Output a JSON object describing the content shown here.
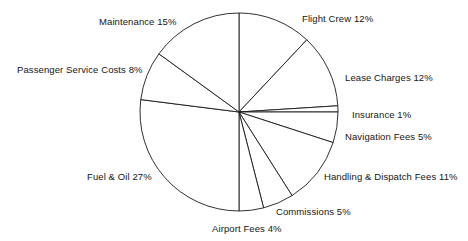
{
  "chart_data": {
    "type": "pie",
    "title": "",
    "subtitle": "",
    "xlabel": "",
    "ylabel": "",
    "legend_position": "none",
    "grid": false,
    "start_angle_deg": 0,
    "direction": "clockwise",
    "units": "percent",
    "total": 100,
    "categories": [
      "Flight Crew",
      "Lease Charges",
      "Insurance",
      "Navigation Fees",
      "Handling & Dispatch Fees",
      "Commissions",
      "Airport Fees",
      "Fuel & Oil",
      "Passenger Service Costs",
      "Maintenance"
    ],
    "values": [
      12,
      12,
      1,
      5,
      11,
      5,
      4,
      27,
      8,
      15
    ],
    "labels": [
      "Flight Crew 12%",
      "Lease Charges 12%",
      "Insurance 1%",
      "Navigation Fees 5%",
      "Handling & Dispatch Fees 11%",
      "Commissions 5%",
      "Airport Fees 4%",
      "Fuel & Oil 27%",
      "Passenger Service Costs 8%",
      "Maintenance 15%"
    ],
    "slice_fill": "#ffffff",
    "slice_stroke": "#1a1a1a",
    "text_color": "#151515"
  },
  "geometry": {
    "center_x": 239,
    "center_y": 112,
    "radius": 99
  },
  "labels": {
    "flight_crew": {
      "text": "Flight Crew 12%",
      "left": 302,
      "top": 13
    },
    "lease_charges": {
      "text": "Lease Charges 12%",
      "left": 345,
      "top": 72
    },
    "insurance": {
      "text": "Insurance 1%",
      "left": 352,
      "top": 109
    },
    "navigation_fees": {
      "text": "Navigation Fees 5%",
      "left": 345,
      "top": 131
    },
    "handling_dispatch_fees": {
      "text": "Handling & Dispatch Fees 11%",
      "left": 324,
      "top": 171
    },
    "commissions": {
      "text": "Commissions 5%",
      "left": 276,
      "top": 206
    },
    "airport_fees": {
      "text": "Airport Fees 4%",
      "left": 212,
      "top": 223
    },
    "fuel_oil": {
      "text": "Fuel & Oil 27%",
      "left": 87,
      "top": 171
    },
    "passenger_service_costs": {
      "text": "Passenger Service Costs 8%",
      "left": 17,
      "top": 64
    },
    "maintenance": {
      "text": "Maintenance 15%",
      "left": 99,
      "top": 16
    }
  }
}
